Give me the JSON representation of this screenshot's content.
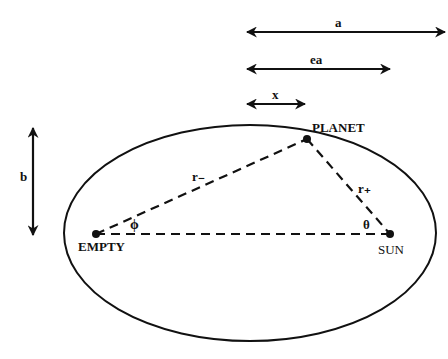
{
  "diagram": {
    "type": "ellipse-orbit",
    "colors": {
      "stroke": "#111111",
      "background": "#ffffff"
    },
    "points": {
      "planet": {
        "label": "PLANET"
      },
      "sun": {
        "label": "SUN"
      },
      "empty": {
        "label": "EMPTY"
      }
    },
    "distances": {
      "r_minus": "r₋",
      "r_plus": "r₊"
    },
    "angles": {
      "phi": "ϕ",
      "theta": "θ"
    },
    "dimension_arrows": {
      "a": "a",
      "ea": "ea",
      "x": "x",
      "b": "b"
    }
  }
}
